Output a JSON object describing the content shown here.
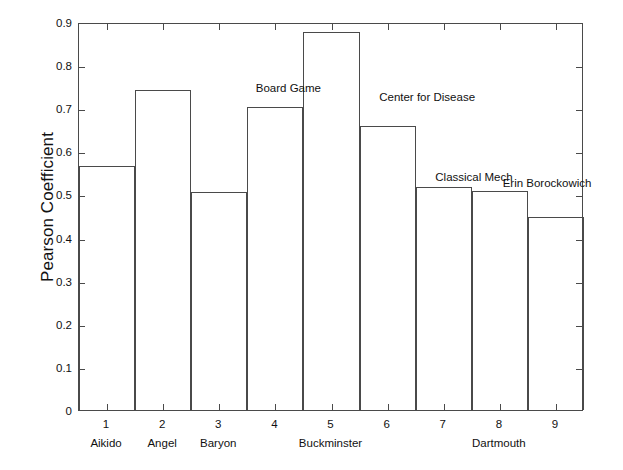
{
  "chart_data": {
    "type": "bar",
    "title": "",
    "xlabel": "",
    "ylabel": "Pearson Coefficient",
    "categories": [
      "1",
      "2",
      "3",
      "4",
      "5",
      "6",
      "7",
      "8",
      "9"
    ],
    "values": [
      0.565,
      0.743,
      0.505,
      0.703,
      0.878,
      0.658,
      0.518,
      0.507,
      0.448
    ],
    "ylim": [
      0,
      0.9
    ],
    "xlim": [
      0.5,
      9.5
    ],
    "grid": false,
    "legend": "none",
    "yticks": [
      "0",
      "0.1",
      "0.2",
      "0.3",
      "0.4",
      "0.5",
      "0.6",
      "0.7",
      "0.8",
      "0.9"
    ],
    "ytick_values": [
      0,
      0.1,
      0.2,
      0.3,
      0.4,
      0.5,
      0.6,
      0.7,
      0.8,
      0.9
    ],
    "xtick_labels": [
      "1",
      "2",
      "3",
      "4",
      "5",
      "6",
      "7",
      "8",
      "9"
    ],
    "group_labels": [
      {
        "text": "Aikido",
        "x": 1
      },
      {
        "text": "Angel",
        "x": 2
      },
      {
        "text": "Baryon",
        "x": 3
      },
      {
        "text": "Buckminster",
        "x": 5
      },
      {
        "text": "Dartmouth",
        "x": 8
      }
    ],
    "annotations": [
      {
        "text": "Board Game",
        "x": 3.65,
        "y": 0.765
      },
      {
        "text": "Center for Disease",
        "x": 5.85,
        "y": 0.745
      },
      {
        "text": "Classical Mech",
        "x": 6.85,
        "y": 0.56
      },
      {
        "text": "Erin Borockowich",
        "x": 8.05,
        "y": 0.545
      }
    ],
    "bar_edge_color": "#4a4a4a",
    "bar_fill_color": "#ffffff",
    "axis_color": "#4a4a4a",
    "background_color": "#ffffff"
  }
}
